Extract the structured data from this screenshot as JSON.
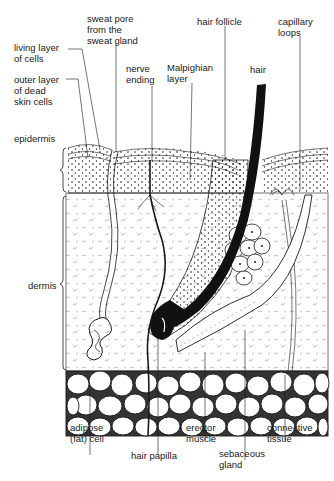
{
  "diagram": {
    "background": "#ffffff",
    "ink_color": "#1a1a1a",
    "layers": {
      "epidermis": "epidermis",
      "dermis": "dermis"
    },
    "labels": {
      "sweat_pore": "sweat pore\nfrom the\nsweat gland",
      "living_layer": "living layer\nof cells",
      "outer_layer": "outer layer\nof dead\nskin cells",
      "nerve_ending": "nerve\nending",
      "malpighian_layer": "Malpighian\nlayer",
      "hair_follicle": "hair follicle",
      "hair": "hair",
      "capillary_loops": "capillary\nloops",
      "epidermis": "epidermis",
      "dermis": "dermis",
      "adipose_cell": "adipose\n(fat) cell",
      "hair_papilla": "hair papilla",
      "erector_muscle": "erector\nmuscle",
      "sebaceous_gland": "sebaceous\ngland",
      "connective_tissue": "connective\ntissue"
    }
  }
}
